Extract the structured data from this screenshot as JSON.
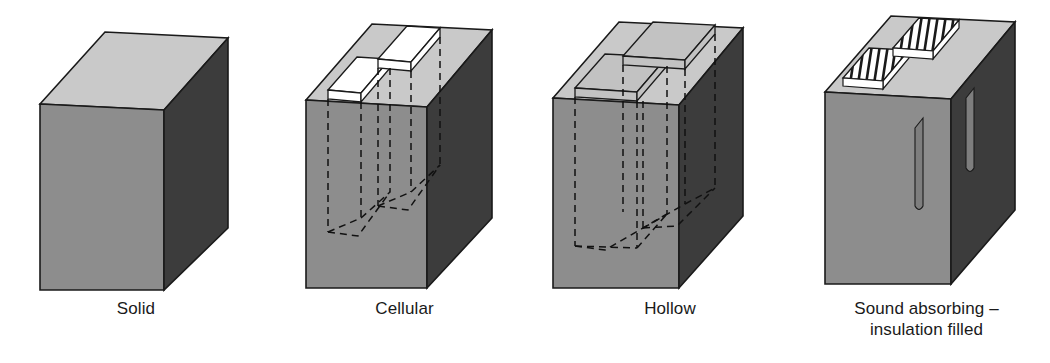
{
  "figure": {
    "background_color": "#ffffff",
    "palette": {
      "top_face": "#c9c9c9",
      "left_face": "#8d8d8d",
      "front_face": "#3c3c3c",
      "cavity_fill": "#ffffff",
      "cavity_inner": "#c2c2c2",
      "slot_face": "#7e7e7e",
      "outline": "#1a1a1a",
      "hidden_line": "#111111",
      "label_text": "#1a1a1a"
    },
    "blocks": [
      {
        "id": "solid",
        "label": "Solid",
        "description": "Solid concrete block with no cavities",
        "cavity_count": 0,
        "cavity_style": "none",
        "hidden_lines": false
      },
      {
        "id": "cellular",
        "label": "Cellular",
        "description": "Block with two closed-end cells opening at the top face",
        "cavity_count": 2,
        "cavity_style": "closed-end-cells",
        "hidden_lines": true
      },
      {
        "id": "hollow",
        "label": "Hollow",
        "description": "Block with two large cavities passing right through",
        "cavity_count": 2,
        "cavity_style": "through-voids",
        "hidden_lines": true
      },
      {
        "id": "sound-absorbing",
        "label": "Sound absorbing –\ninsulation filled",
        "description": "Slotted block with insulation packed into the slots",
        "cavity_count": 2,
        "cavity_style": "slots-with-insulation",
        "hidden_lines": false,
        "insulation_hatch_lines": 7
      }
    ]
  }
}
